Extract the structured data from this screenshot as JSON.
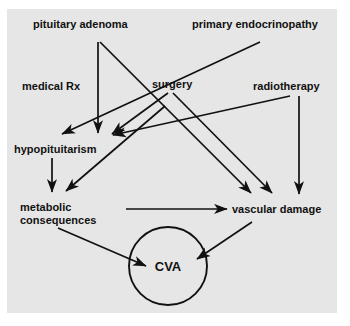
{
  "figure": {
    "type": "flowchart",
    "panel_color": "#e6e6e6",
    "background_color": "#ffffff",
    "line_color": "#111111",
    "text_color": "#111111"
  },
  "nodes": {
    "pituitary_adenoma": "pituitary adenoma",
    "primary_endocrinopathy": "primary endocrinopathy",
    "medical_rx": "medical Rx",
    "surgery": "surgery",
    "radiotherapy": "radiotherapy",
    "hypopituitarism": "hypopituitarism",
    "metabolic_consequences": "metabolic consequences",
    "vascular_damage": "vascular damage",
    "cva": "CVA"
  },
  "edges": [
    {
      "from": "pituitary adenoma",
      "to": "hypopituitarism"
    },
    {
      "from": "pituitary adenoma",
      "to": "vascular damage"
    },
    {
      "from": "primary endocrinopathy",
      "to": "hypopituitarism"
    },
    {
      "from": "surgery",
      "to": "hypopituitarism"
    },
    {
      "from": "surgery",
      "to": "vascular damage"
    },
    {
      "from": "medical Rx",
      "to": "metabolic consequences"
    },
    {
      "from": "radiotherapy",
      "to": "hypopituitarism"
    },
    {
      "from": "radiotherapy",
      "to": "vascular damage"
    },
    {
      "from": "hypopituitarism",
      "to": "metabolic consequences"
    },
    {
      "from": "metabolic consequences",
      "to": "vascular damage"
    },
    {
      "from": "metabolic consequences",
      "to": "CVA"
    },
    {
      "from": "vascular damage",
      "to": "CVA"
    }
  ]
}
